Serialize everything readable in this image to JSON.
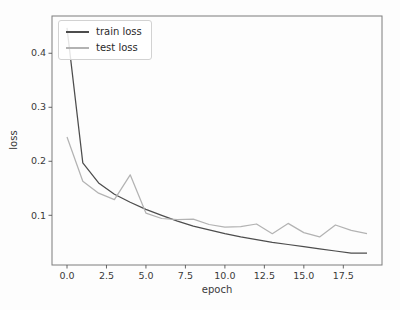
{
  "figure": {
    "background": "#fdfdfd",
    "spine_color": "#7d7d7d",
    "tick_color": "#555555",
    "tick_label_color": "#3a3a3a"
  },
  "chart_data": {
    "type": "line",
    "title": "",
    "xlabel": "epoch",
    "ylabel": "loss",
    "grid": false,
    "legend_position": "upper-left",
    "xlim": [
      -0.95,
      19.95
    ],
    "ylim": [
      0.008,
      0.469
    ],
    "x": [
      0,
      1,
      2,
      3,
      4,
      5,
      6,
      7,
      8,
      9,
      10,
      11,
      12,
      13,
      14,
      15,
      16,
      17,
      18,
      19
    ],
    "series": [
      {
        "name": "train loss",
        "color": "#4d4d4d",
        "values": [
          0.447,
          0.197,
          0.16,
          0.139,
          0.124,
          0.111,
          0.1,
          0.089,
          0.08,
          0.073,
          0.066,
          0.06,
          0.055,
          0.05,
          0.046,
          0.042,
          0.038,
          0.034,
          0.03,
          0.03
        ]
      },
      {
        "name": "test loss",
        "color": "#b3b3b3",
        "values": [
          0.245,
          0.163,
          0.141,
          0.129,
          0.175,
          0.104,
          0.094,
          0.092,
          0.093,
          0.083,
          0.078,
          0.079,
          0.084,
          0.066,
          0.085,
          0.068,
          0.06,
          0.082,
          0.072,
          0.066
        ]
      }
    ],
    "xticks": {
      "values": [
        0,
        2.5,
        5,
        7.5,
        10,
        12.5,
        15,
        17.5
      ],
      "labels": [
        "0.0",
        "2.5",
        "5.0",
        "7.5",
        "10.0",
        "12.5",
        "15.0",
        "17.5"
      ]
    },
    "yticks": {
      "values": [
        0.1,
        0.2,
        0.3,
        0.4
      ],
      "labels": [
        "0.1",
        "0.2",
        "0.3",
        "0.4"
      ]
    }
  }
}
